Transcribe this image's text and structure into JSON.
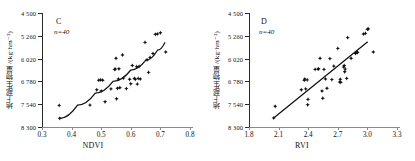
{
  "figure": {
    "panels": [
      {
        "id": "panel-c",
        "tag": "C",
        "n_label": "n=40",
        "xlabel": "NDVI",
        "ylabel": "地上部生物量 /(kg·hm⁻²)",
        "xticks": [
          "0.3",
          "0.4",
          "0.5",
          "0.6",
          "0.7",
          "0.8"
        ],
        "yticks": [
          "8 300",
          "7 540",
          "6 780",
          "6 020",
          "5 260",
          "4 500"
        ]
      },
      {
        "id": "panel-d",
        "tag": "D",
        "n_label": "n=40",
        "xlabel": "RVI",
        "ylabel": "地上部生物量 /(kg·hm⁻²)",
        "xticks": [
          "1.8",
          "2.1",
          "2.4",
          "2.7",
          "3.0",
          "3.3"
        ],
        "yticks": [
          "8 300",
          "7 540",
          "6 780",
          "6 020",
          "5 260",
          "4 500"
        ]
      }
    ]
  },
  "chart_data": [
    {
      "type": "scatter",
      "panel": "C",
      "title": "",
      "xlabel": "NDVI",
      "ylabel": "地上部生物量 /(kg·hm⁻²)",
      "n": 40,
      "xlim": [
        0.3,
        0.8
      ],
      "ylim": [
        4500,
        8300
      ],
      "xticks": [
        0.3,
        0.4,
        0.5,
        0.6,
        0.7,
        0.8
      ],
      "yticks": [
        4500,
        5260,
        6020,
        6780,
        7540,
        8300
      ],
      "grid": false,
      "legend": null,
      "annotations": [
        "C",
        "n=40"
      ],
      "points": [
        [
          0.358,
          5220
        ],
        [
          0.36,
          4790
        ],
        [
          0.462,
          5230
        ],
        [
          0.485,
          5740
        ],
        [
          0.492,
          6060
        ],
        [
          0.498,
          6070
        ],
        [
          0.5,
          5700
        ],
        [
          0.505,
          6060
        ],
        [
          0.513,
          5340
        ],
        [
          0.533,
          5770
        ],
        [
          0.545,
          6420
        ],
        [
          0.548,
          6430
        ],
        [
          0.55,
          6790
        ],
        [
          0.552,
          5440
        ],
        [
          0.555,
          5790
        ],
        [
          0.558,
          6100
        ],
        [
          0.56,
          6440
        ],
        [
          0.563,
          5810
        ],
        [
          0.572,
          6900
        ],
        [
          0.575,
          6130
        ],
        [
          0.585,
          5780
        ],
        [
          0.596,
          6090
        ],
        [
          0.6,
          5940
        ],
        [
          0.605,
          6550
        ],
        [
          0.612,
          6120
        ],
        [
          0.615,
          6090
        ],
        [
          0.62,
          6510
        ],
        [
          0.622,
          5930
        ],
        [
          0.625,
          6120
        ],
        [
          0.628,
          6520
        ],
        [
          0.632,
          6100
        ],
        [
          0.648,
          7320
        ],
        [
          0.655,
          6740
        ],
        [
          0.66,
          6320
        ],
        [
          0.665,
          6820
        ],
        [
          0.675,
          6950
        ],
        [
          0.683,
          7590
        ],
        [
          0.69,
          7600
        ],
        [
          0.7,
          7640
        ],
        [
          0.718,
          7000
        ]
      ],
      "fit": {
        "style": "curve",
        "description": "increasing curve flattening at high NDVI",
        "path": [
          [
            0.36,
            4790
          ],
          [
            0.42,
            5230
          ],
          [
            0.48,
            5630
          ],
          [
            0.54,
            6020
          ],
          [
            0.6,
            6400
          ],
          [
            0.65,
            6720
          ],
          [
            0.69,
            7060
          ],
          [
            0.715,
            7310
          ]
        ]
      }
    },
    {
      "type": "scatter",
      "panel": "D",
      "title": "",
      "xlabel": "RVI",
      "ylabel": "地上部生物量 /(kg·hm⁻²)",
      "n": 40,
      "xlim": [
        1.8,
        3.3
      ],
      "ylim": [
        4500,
        8300
      ],
      "xticks": [
        1.8,
        2.1,
        2.4,
        2.7,
        3.0,
        3.3
      ],
      "yticks": [
        4500,
        5260,
        6020,
        6780,
        7540,
        8300
      ],
      "grid": false,
      "legend": null,
      "annotations": [
        "D",
        "n=40"
      ],
      "points": [
        [
          2.05,
          4800
        ],
        [
          2.065,
          5190
        ],
        [
          2.33,
          5740
        ],
        [
          2.36,
          6060
        ],
        [
          2.365,
          6100
        ],
        [
          2.375,
          5770
        ],
        [
          2.39,
          6070
        ],
        [
          2.395,
          5240
        ],
        [
          2.398,
          5420
        ],
        [
          2.47,
          6420
        ],
        [
          2.5,
          6430
        ],
        [
          2.505,
          6440
        ],
        [
          2.52,
          6790
        ],
        [
          2.54,
          5700
        ],
        [
          2.548,
          5460
        ],
        [
          2.56,
          6420
        ],
        [
          2.575,
          6100
        ],
        [
          2.59,
          5790
        ],
        [
          2.62,
          6780
        ],
        [
          2.64,
          6080
        ],
        [
          2.66,
          6530
        ],
        [
          2.7,
          7120
        ],
        [
          2.72,
          6000
        ],
        [
          2.725,
          6090
        ],
        [
          2.73,
          5990
        ],
        [
          2.76,
          6500
        ],
        [
          2.765,
          6550
        ],
        [
          2.77,
          6340
        ],
        [
          2.775,
          6430
        ],
        [
          2.79,
          6120
        ],
        [
          2.8,
          7480
        ],
        [
          2.835,
          6790
        ],
        [
          2.88,
          6950
        ],
        [
          2.895,
          7000
        ],
        [
          2.9,
          6980
        ],
        [
          2.96,
          7600
        ],
        [
          2.98,
          7620
        ],
        [
          3.0,
          7760
        ],
        [
          3.01,
          7770
        ],
        [
          3.06,
          7000
        ]
      ],
      "fit": {
        "style": "line",
        "description": "linear increase across RVI range",
        "path": [
          [
            2.05,
            4800
          ],
          [
            3.0,
            7330
          ]
        ]
      }
    }
  ]
}
